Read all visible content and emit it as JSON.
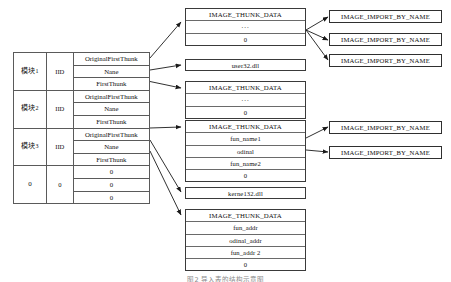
{
  "diagram": {
    "caption": "图2  导入表的结构示意图"
  },
  "descriptor_table": {
    "name": "IMAGE_IMPORT_DESCRIPTOR array",
    "rows": [
      {
        "module": "模块",
        "module_index": "1",
        "iid": "IID",
        "fields": [
          "OriginalFirstThunk",
          "Nane",
          "FirstThunk"
        ]
      },
      {
        "module": "模块",
        "module_index": "2",
        "iid": "IID",
        "fields": [
          "OriginalFirstThunk",
          "Nane",
          "FirstThunk"
        ]
      },
      {
        "module": "模块",
        "module_index": "3",
        "iid": "IID",
        "fields": [
          "OriginalFirstThunk",
          "Nane",
          "FirstThunk"
        ]
      },
      {
        "module": "0",
        "module_index": "",
        "iid": "0",
        "fields": [
          "0",
          "0",
          "0"
        ]
      }
    ]
  },
  "thunk_blocks": [
    {
      "id": "thunk-top",
      "header": "IMAGE_THUNK_DATA",
      "rows": [
        "...",
        "0"
      ]
    },
    {
      "id": "thunk-middle",
      "header": "IMAGE_THUNK_DATA",
      "rows": [
        "...",
        "0"
      ]
    },
    {
      "id": "thunk-names",
      "header": "IMAGE_THUNK_DATA",
      "rows": [
        "fun_name1",
        "odinal",
        "fun_name2",
        "0"
      ]
    },
    {
      "id": "thunk-addrs",
      "header": "IMAGE_THUNK_DATA",
      "rows": [
        "fun_addr",
        "odinal_addr",
        "fun_addr 2",
        "0"
      ]
    }
  ],
  "dll_boxes": [
    {
      "id": "dll-user32",
      "label": "user32.dll"
    },
    {
      "id": "dll-kernel32",
      "label": "kerne132.dll"
    }
  ],
  "import_by_name_boxes": [
    {
      "id": "ibn-1",
      "label": "IMAGE_IMPORT_BY_NAME"
    },
    {
      "id": "ibn-2",
      "label": "IMAGE_IMPORT_BY_NAME"
    },
    {
      "id": "ibn-3",
      "label": "IMAGE_IMPORT_BY_NAME"
    },
    {
      "id": "ibn-4",
      "label": "IMAGE_IMPORT_BY_NAME"
    },
    {
      "id": "ibn-5",
      "label": "IMAGE_IMPORT_BY_NAME"
    }
  ],
  "colors": {
    "border": "#3a3a3a",
    "inner_border": "#6a6a6a",
    "text": "#111111",
    "background": "#ffffff"
  }
}
